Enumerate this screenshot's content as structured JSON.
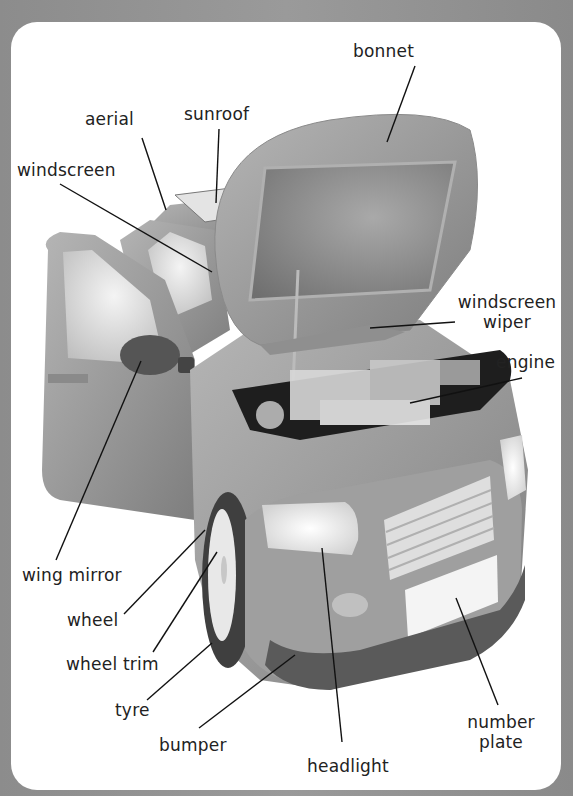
{
  "diagram": {
    "labels": [
      {
        "id": "bonnet",
        "text": "bonnet"
      },
      {
        "id": "aerial",
        "text": "aerial"
      },
      {
        "id": "sunroof",
        "text": "sunroof"
      },
      {
        "id": "windscreen",
        "text": "windscreen"
      },
      {
        "id": "windscreen_wiper",
        "text": "windscreen\nwiper",
        "line1": "windscreen",
        "line2": "wiper"
      },
      {
        "id": "engine",
        "text": "engine"
      },
      {
        "id": "wing_mirror",
        "text": "wing mirror"
      },
      {
        "id": "wheel",
        "text": "wheel"
      },
      {
        "id": "wheel_trim",
        "text": "wheel trim"
      },
      {
        "id": "tyre",
        "text": "tyre"
      },
      {
        "id": "bumper",
        "text": "bumper"
      },
      {
        "id": "headlight",
        "text": "headlight"
      },
      {
        "id": "number_plate",
        "text": "number\nplate",
        "line1": "number",
        "line2": "plate"
      }
    ]
  },
  "colors": {
    "background": "#8c8c8c",
    "panel": "#ffffff",
    "car_body": "#9e9e9e",
    "text": "#222222"
  }
}
